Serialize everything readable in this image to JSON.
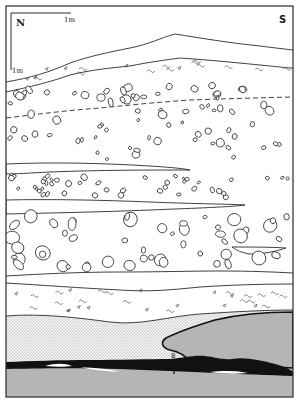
{
  "figure": {
    "type": "stratigraphic section",
    "orientation": {
      "left_label": "N",
      "right_label": "S"
    },
    "scale": {
      "horizontal_label": "1m",
      "vertical_label": "1m"
    },
    "sample_marker": "8",
    "colors": {
      "frame": "#2a2a2a",
      "bedrock": "#b5b5b5",
      "dark_layer": "#111111",
      "stipple": "#8c8c8c",
      "background": "#ffffff"
    },
    "layers": [
      {
        "name": "topsoil-silt-with-wavy-marks",
        "pattern": "squiggles"
      },
      {
        "name": "coarse-gravel-upper",
        "pattern": "pebbles"
      },
      {
        "name": "fine-gravel-band",
        "pattern": "pebbles"
      },
      {
        "name": "sand-lens-upper",
        "pattern": "stipple"
      },
      {
        "name": "gravel-with-sand-lens",
        "pattern": "pebbles"
      },
      {
        "name": "coarse-cobbles",
        "pattern": "pebbles"
      },
      {
        "name": "silt-with-wavy-marks-lower",
        "pattern": "squiggles"
      },
      {
        "name": "sand-layer",
        "pattern": "stipple"
      },
      {
        "name": "dark-organic-layer",
        "pattern": "solid-black"
      },
      {
        "name": "bedrock",
        "pattern": "solid-gray"
      }
    ]
  }
}
